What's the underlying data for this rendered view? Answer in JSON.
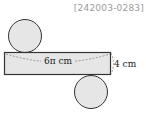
{
  "problem_id": "[242003-0283]",
  "diagram": {
    "type": "cylinder-net",
    "rectangle_width_label": "6π cm",
    "rectangle_height_label": "4 cm",
    "colors": {
      "fill": "#e6e6e6",
      "stroke": "#333333",
      "dashed": "#777777"
    }
  }
}
